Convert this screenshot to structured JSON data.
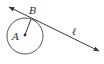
{
  "diagram": {
    "colors": {
      "stroke": "#3a3a3a",
      "text": "#2a2a2a",
      "background": "#ffffff"
    },
    "circle": {
      "center_label": "A",
      "cx": 25,
      "cy": 36,
      "r": 18
    },
    "points": [
      {
        "label": "A",
        "x": 25,
        "y": 35
      },
      {
        "label": "B",
        "x": 31,
        "y": 19
      }
    ],
    "line": {
      "label": "ℓ",
      "x1": 9,
      "y1": 7,
      "x2": 99,
      "y2": 51,
      "arrows": "both"
    },
    "labels": {
      "A": "A",
      "B": "B",
      "line": "ℓ"
    }
  }
}
